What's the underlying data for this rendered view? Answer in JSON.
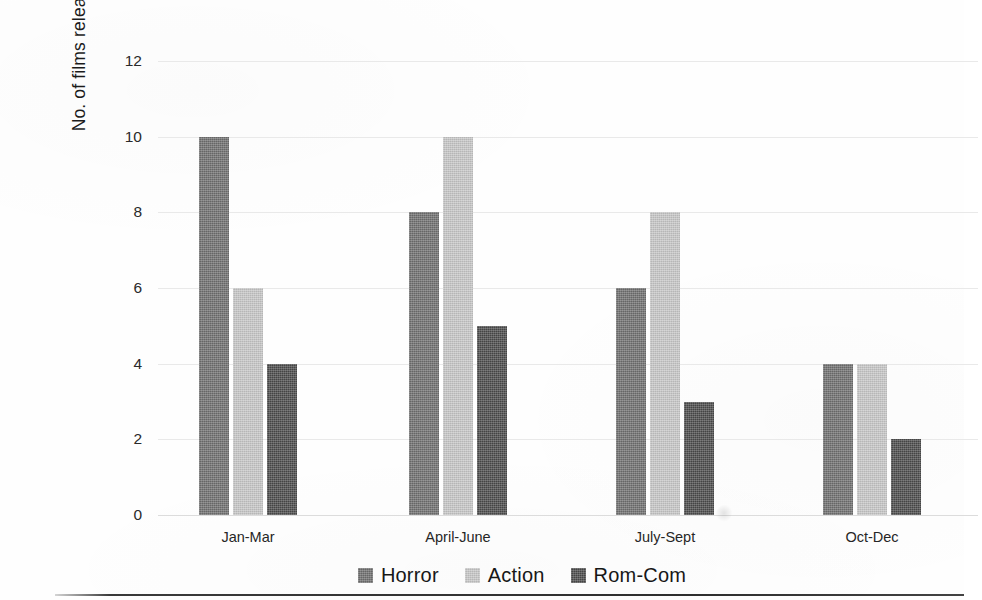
{
  "chart_data": {
    "type": "bar",
    "title": "",
    "subtitle": "",
    "xlabel": "",
    "ylabel": "No. of films released",
    "categories": [
      "Jan-Mar",
      "April-June",
      "July-Sept",
      "Oct-Dec"
    ],
    "series": [
      {
        "name": "Horror",
        "values": [
          10,
          8,
          6,
          4
        ],
        "color": "#6e6e6e"
      },
      {
        "name": "Action",
        "values": [
          6,
          10,
          8,
          4
        ],
        "color": "#c6c6c6"
      },
      {
        "name": "Rom-Com",
        "values": [
          4,
          5,
          3,
          2
        ],
        "color": "#4a4a4a"
      }
    ],
    "ylim": [
      0,
      12
    ],
    "yticks": [
      0,
      2,
      4,
      6,
      8,
      10,
      12
    ],
    "ytick_labels": [
      "0",
      "2",
      "4",
      "6",
      "8",
      "10",
      "12"
    ],
    "grid": true,
    "grid_axis": "y",
    "legend_position": "bottom-center",
    "bar_group_mode": "grouped"
  },
  "colors": {
    "horror": "#6e6e6e",
    "action": "#c6c6c6",
    "romcom": "#4a4a4a",
    "gridline": "#e9e9e9",
    "axis_text": "#262626",
    "background": "#fefefe"
  }
}
